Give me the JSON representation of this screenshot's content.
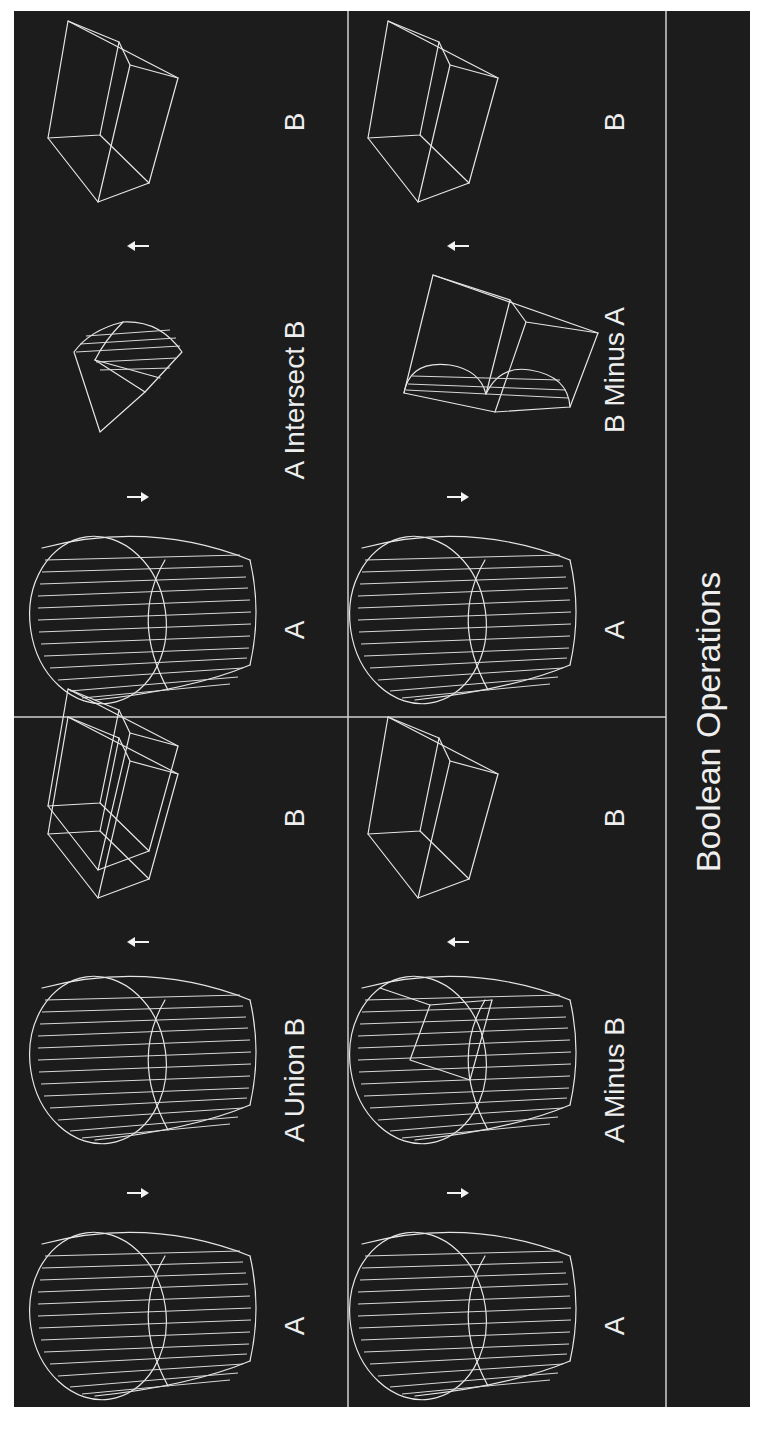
{
  "figure": {
    "title": "Boolean Operations",
    "orientation": "rotated 90 degrees counter-clockwise",
    "panels": [
      {
        "operation": "A Union B",
        "labels": {
          "left": "A",
          "result": "A Union B",
          "right": "B"
        }
      },
      {
        "operation": "A Intersect B",
        "labels": {
          "left": "A",
          "result": "A Intersect B",
          "right": "B"
        }
      },
      {
        "operation": "A Minus B",
        "labels": {
          "left": "A",
          "result": "A Minus B",
          "right": "B"
        }
      },
      {
        "operation": "B Minus A",
        "labels": {
          "left": "A",
          "result": "B Minus A",
          "right": "B"
        }
      }
    ],
    "shapes": {
      "A": "cylinder-wireframe",
      "B": "cube-wireframe"
    },
    "colors": {
      "background": "#ffffff",
      "panel": "#1c1c1c",
      "line": "#e6e6e6"
    }
  }
}
